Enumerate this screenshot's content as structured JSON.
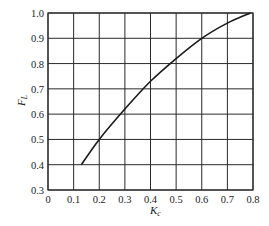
{
  "chart_data": {
    "type": "line",
    "title": "",
    "xlabel": "K_c",
    "ylabel": "F_L",
    "xlim": [
      0,
      0.8
    ],
    "ylim": [
      0.3,
      1.0
    ],
    "grid": true,
    "legend": null,
    "xticks": [
      "0",
      "0.1",
      "0.2",
      "0.3",
      "0.4",
      "0.5",
      "0.6",
      "0.7",
      "0.8"
    ],
    "yticks": [
      "0.3",
      "0.4",
      "0.5",
      "0.6",
      "0.7",
      "0.8",
      "0.9",
      "1.0"
    ],
    "series": [
      {
        "name": "F_L vs K_c",
        "x": [
          0.13,
          0.2,
          0.3,
          0.4,
          0.5,
          0.6,
          0.7,
          0.79
        ],
        "y": [
          0.4,
          0.5,
          0.62,
          0.73,
          0.82,
          0.9,
          0.96,
          1.0
        ]
      }
    ],
    "colors": {
      "line": "#1a1a1a",
      "grid": "#2a2a2a",
      "text": "#222222"
    }
  },
  "labels": {
    "x_main": "K",
    "x_sub": "c",
    "y_main": "F",
    "y_sub": "L"
  }
}
